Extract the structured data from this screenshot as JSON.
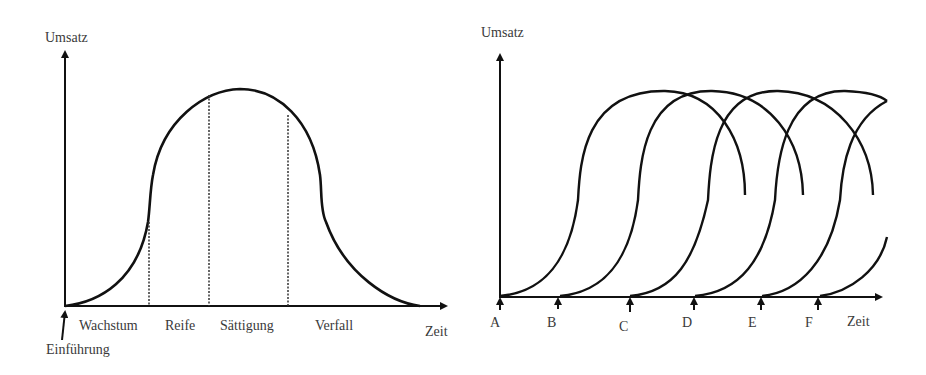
{
  "left_diagram": {
    "title": "Produktlebenszyklus",
    "y_axis_label": "Umsatz",
    "x_axis_label": "Zeit",
    "start_marker_label": "Einführung",
    "phases": [
      "Wachstum",
      "Reife",
      "Sättigung",
      "Verfall"
    ]
  },
  "right_diagram": {
    "title": "Überlappende Produktlebenszyklen",
    "y_axis_label": "Umsatz",
    "x_axis_label": "Zeit",
    "markers": [
      "A",
      "B",
      "C",
      "D",
      "E",
      "F"
    ]
  },
  "colors": {
    "line": "#111111",
    "text": "#3a3a3a",
    "background": "#ffffff"
  }
}
